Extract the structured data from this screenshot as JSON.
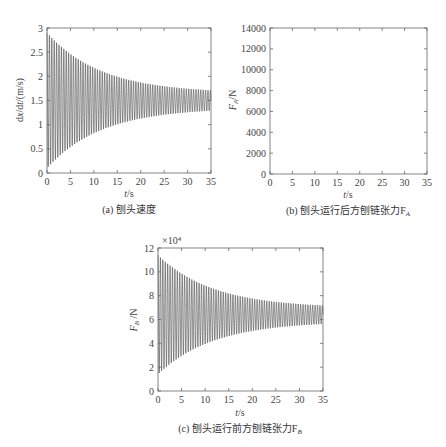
{
  "chart_data": [
    {
      "id": "a",
      "type": "line",
      "caption": "(a) 刨头速度",
      "xlabel": "t/s",
      "ylabel": "dx/dt/(m/s)",
      "xlim": [
        0,
        35
      ],
      "ylim": [
        0,
        3
      ],
      "xticks": [
        0,
        5,
        10,
        15,
        20,
        25,
        30,
        35
      ],
      "yticks": [
        0,
        0.5,
        1,
        1.5,
        2,
        2.5,
        3
      ],
      "ytick_labels": [
        "0",
        "0.5",
        "1",
        "1.5",
        "2",
        "2.5",
        "3"
      ],
      "grid": false,
      "series": [
        {
          "name": "velocity",
          "description": "damped oscillation around mean",
          "mean": 1.5,
          "initial_amplitude": 1.4,
          "final_amplitude": 0.15,
          "frequency_hz": 1.95,
          "x": [
            0,
            5,
            10,
            15,
            20,
            25,
            30,
            35
          ],
          "upper_envelope": [
            2.9,
            2.55,
            2.25,
            2.0,
            1.82,
            1.72,
            1.67,
            1.65
          ],
          "lower_envelope": [
            0.1,
            0.45,
            0.75,
            1.0,
            1.18,
            1.28,
            1.33,
            1.35
          ]
        }
      ]
    },
    {
      "id": "b",
      "type": "line",
      "caption": "(b) 刨头运行后方刨链张力F",
      "caption_sub": "A",
      "xlabel": "t/s",
      "ylabel": "F",
      "ylabel_sub": "A",
      "ylabel_unit": "/N",
      "xlim": [
        0,
        35
      ],
      "ylim": [
        0,
        14000
      ],
      "xticks": [
        0,
        5,
        10,
        15,
        20,
        25,
        30,
        35
      ],
      "yticks": [
        0,
        2000,
        4000,
        6000,
        8000,
        10000,
        12000,
        14000
      ],
      "ytick_labels": [
        "0",
        "2000",
        "4000",
        "6000",
        "8000",
        "10000",
        "12000",
        "14000"
      ],
      "grid": false,
      "series": []
    },
    {
      "id": "c",
      "type": "line",
      "caption": "(c) 刨头运行前方刨链张力F",
      "caption_sub": "B",
      "xlabel": "t/s",
      "ylabel": "F",
      "ylabel_sub": "B",
      "ylabel_unit": " /N",
      "y_multiplier": "×10⁴",
      "xlim": [
        0,
        35
      ],
      "ylim": [
        0,
        12
      ],
      "xticks": [
        0,
        5,
        10,
        15,
        20,
        25,
        30,
        35
      ],
      "yticks": [
        0,
        2,
        4,
        6,
        8,
        10,
        12
      ],
      "ytick_labels": [
        "0",
        "2",
        "4",
        "6",
        "8",
        "10",
        "12"
      ],
      "grid": false,
      "series": [
        {
          "name": "F_B",
          "description": "damped oscillation around mean (×10^4 N)",
          "mean": 6.4,
          "initial_amplitude": 5.0,
          "final_amplitude": 0.55,
          "frequency_hz": 1.95,
          "x": [
            0,
            5,
            10,
            15,
            20,
            25,
            30,
            35
          ],
          "upper_envelope": [
            11.4,
            10.0,
            8.9,
            8.0,
            7.5,
            7.2,
            7.0,
            6.95
          ],
          "lower_envelope": [
            1.5,
            2.8,
            3.9,
            4.8,
            5.3,
            5.6,
            5.8,
            5.85
          ]
        }
      ]
    }
  ]
}
